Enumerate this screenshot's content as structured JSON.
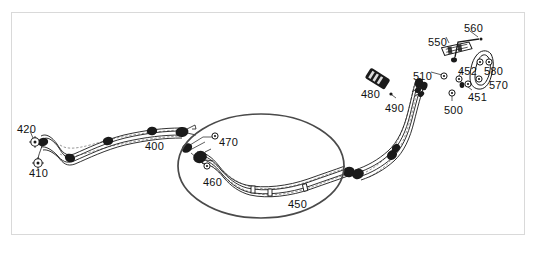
{
  "figure": {
    "kind": "exploded-parts-diagram",
    "frame": {
      "border_color": "#d9d9d9",
      "background": "#ffffff"
    },
    "ink_color": "#1a1a1a",
    "highlight": {
      "shape": "ellipse",
      "name": "highlight-ellipse",
      "stroke_color": "#4a4a4a",
      "cx": 261,
      "cy": 166,
      "rx": 83,
      "ry": 52
    }
  },
  "callouts": [
    {
      "id": "400",
      "label": "400",
      "x": 145,
      "y": 141
    },
    {
      "id": "410",
      "label": "410",
      "x": 29,
      "y": 168
    },
    {
      "id": "420",
      "label": "420",
      "x": 17,
      "y": 124
    },
    {
      "id": "450",
      "label": "450",
      "x": 288,
      "y": 199
    },
    {
      "id": "460",
      "label": "460",
      "x": 203,
      "y": 177
    },
    {
      "id": "470",
      "label": "470",
      "x": 219,
      "y": 137
    },
    {
      "id": "480",
      "label": "480",
      "x": 361,
      "y": 89
    },
    {
      "id": "490",
      "label": "490",
      "x": 385,
      "y": 103
    },
    {
      "id": "500",
      "label": "500",
      "x": 444,
      "y": 105
    },
    {
      "id": "510",
      "label": "510",
      "x": 413,
      "y": 71
    },
    {
      "id": "550",
      "label": "550",
      "x": 428,
      "y": 37
    },
    {
      "id": "560",
      "label": "560",
      "x": 464,
      "y": 23
    },
    {
      "id": "451",
      "label": "451",
      "x": 468,
      "y": 92
    },
    {
      "id": "452",
      "label": "452",
      "x": 458,
      "y": 66
    },
    {
      "id": "570",
      "label": "570",
      "x": 489,
      "y": 80
    },
    {
      "id": "580",
      "label": "580",
      "x": 484,
      "y": 66
    }
  ]
}
